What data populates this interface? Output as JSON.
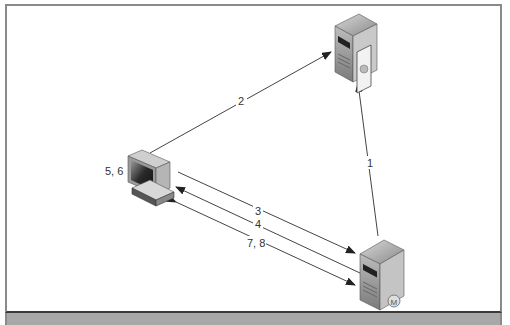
{
  "diagram": {
    "nodes": [
      {
        "id": "server-top",
        "type": "server",
        "icon": "server-certificate-icon"
      },
      {
        "id": "workstation",
        "type": "workstation",
        "label": "5, 6",
        "icon": "workstation-icon"
      },
      {
        "id": "server-bottom",
        "type": "server",
        "icon": "server-m-icon"
      }
    ],
    "edges": [
      {
        "label": "1",
        "from": "server-bottom",
        "to": "server-top"
      },
      {
        "label": "2",
        "from": "workstation",
        "to": "server-top"
      },
      {
        "label": "3",
        "from": "workstation",
        "to": "server-bottom"
      },
      {
        "label": "4",
        "from": "server-bottom",
        "to": "workstation"
      },
      {
        "label": "7, 8",
        "from": "workstation",
        "to": "server-bottom",
        "bidirectional": true
      }
    ]
  },
  "colors": {
    "line": "#444444",
    "border": "#8a8a8a",
    "band": "#a8a8a8"
  }
}
